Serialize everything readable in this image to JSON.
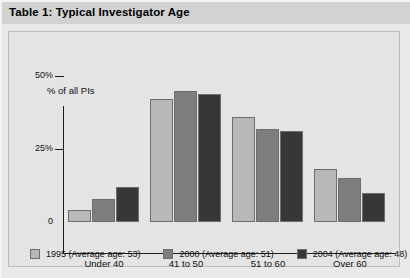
{
  "title": "Table 1: Typical Investigator Age",
  "colors": {
    "series_1995": "#b8b8b8",
    "series_2000": "#7d7d7d",
    "series_2004": "#373737",
    "panel_background": "#e4e4e4",
    "title_background": "#d2d2d2",
    "axis": "#1d1d1d"
  },
  "chart_data": {
    "type": "bar",
    "title": "Table 1: Typical Investigator Age",
    "xlabel": "",
    "ylabel": "% of all PIs",
    "ylim": [
      0,
      50
    ],
    "yticks": [
      "0",
      "25%",
      "50%"
    ],
    "grid": false,
    "legend_position": "bottom",
    "categories": [
      "Under 40",
      "41 to 50",
      "51 to 60",
      "Over 60"
    ],
    "series": [
      {
        "name": "1995 (Average age: 53)",
        "color": "#b8b8b8",
        "values": [
          4,
          42,
          36,
          18
        ]
      },
      {
        "name": "2000 (Average age: 51)",
        "color": "#7d7d7d",
        "values": [
          8,
          45,
          32,
          15
        ]
      },
      {
        "name": "2004 (Average age: 48)",
        "color": "#373737",
        "values": [
          12,
          44,
          31,
          10
        ]
      }
    ]
  }
}
